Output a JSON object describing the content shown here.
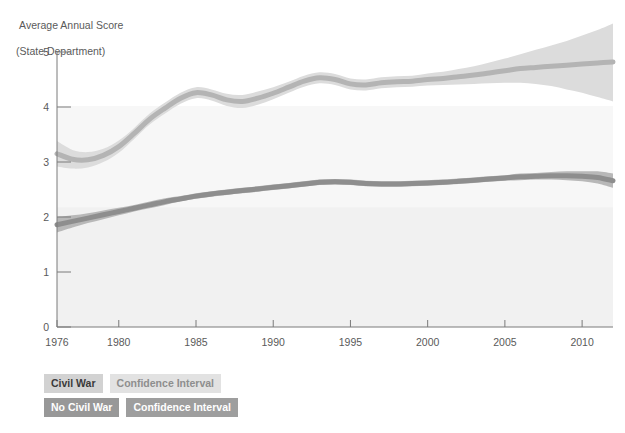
{
  "chart_data": {
    "type": "line",
    "title": "Average Annual Score",
    "subtitle": "(State Department)",
    "ylabel": "Average Annual Score (State Department)",
    "xlabel": "",
    "ylim": [
      0,
      5
    ],
    "xlim": [
      1976,
      2012
    ],
    "grid": false,
    "legend_position": "below-left",
    "y_ticks": [
      "0",
      "1",
      "2",
      "3",
      "4",
      "5"
    ],
    "y_tick_values": [
      0,
      1,
      2,
      3,
      4,
      5
    ],
    "x_ticks": [
      "1976",
      "1980",
      "1985",
      "1990",
      "1995",
      "2000",
      "2005",
      "2010"
    ],
    "x_tick_values": [
      1976,
      1980,
      1985,
      1990,
      1995,
      2000,
      2005,
      2010
    ],
    "x": [
      1976,
      1977,
      1978,
      1979,
      1980,
      1981,
      1982,
      1983,
      1984,
      1985,
      1986,
      1987,
      1988,
      1989,
      1990,
      1991,
      1992,
      1993,
      1994,
      1995,
      1996,
      1997,
      1998,
      1999,
      2000,
      2001,
      2002,
      2003,
      2004,
      2005,
      2006,
      2007,
      2008,
      2009,
      2010,
      2011,
      2012
    ],
    "series": [
      {
        "name": "Civil War",
        "color": "#b4b4b4",
        "band_color": "#dcdcdc",
        "values": [
          3.15,
          3.05,
          3.04,
          3.12,
          3.28,
          3.52,
          3.78,
          3.98,
          4.16,
          4.26,
          4.22,
          4.13,
          4.1,
          4.16,
          4.25,
          4.36,
          4.47,
          4.53,
          4.5,
          4.42,
          4.4,
          4.44,
          4.46,
          4.47,
          4.5,
          4.52,
          4.55,
          4.58,
          4.62,
          4.66,
          4.7,
          4.72,
          4.74,
          4.76,
          4.78,
          4.8,
          4.82
        ],
        "ci_lower": [
          2.92,
          2.88,
          2.9,
          3.0,
          3.17,
          3.42,
          3.68,
          3.88,
          4.06,
          4.16,
          4.12,
          4.02,
          3.98,
          4.04,
          4.14,
          4.26,
          4.37,
          4.43,
          4.4,
          4.32,
          4.3,
          4.34,
          4.36,
          4.37,
          4.39,
          4.4,
          4.41,
          4.42,
          4.43,
          4.44,
          4.44,
          4.42,
          4.38,
          4.32,
          4.26,
          4.18,
          4.1
        ],
        "ci_upper": [
          3.38,
          3.22,
          3.18,
          3.24,
          3.39,
          3.62,
          3.88,
          4.08,
          4.26,
          4.36,
          4.32,
          4.24,
          4.22,
          4.28,
          4.36,
          4.46,
          4.57,
          4.63,
          4.6,
          4.52,
          4.5,
          4.54,
          4.56,
          4.57,
          4.61,
          4.64,
          4.69,
          4.74,
          4.81,
          4.88,
          4.96,
          5.04,
          5.12,
          5.2,
          5.3,
          5.4,
          5.52
        ]
      },
      {
        "name": "No Civil War",
        "color": "#8e8e8e",
        "band_color": "#b8b8b8",
        "values": [
          1.86,
          1.92,
          1.98,
          2.04,
          2.1,
          2.16,
          2.22,
          2.28,
          2.33,
          2.38,
          2.42,
          2.45,
          2.48,
          2.51,
          2.54,
          2.57,
          2.6,
          2.63,
          2.64,
          2.63,
          2.61,
          2.6,
          2.6,
          2.61,
          2.62,
          2.63,
          2.65,
          2.67,
          2.69,
          2.71,
          2.73,
          2.74,
          2.75,
          2.75,
          2.74,
          2.72,
          2.66
        ],
        "ci_lower": [
          1.72,
          1.81,
          1.89,
          1.96,
          2.03,
          2.1,
          2.16,
          2.22,
          2.28,
          2.33,
          2.37,
          2.4,
          2.43,
          2.46,
          2.49,
          2.52,
          2.55,
          2.58,
          2.59,
          2.58,
          2.56,
          2.55,
          2.55,
          2.56,
          2.57,
          2.58,
          2.6,
          2.62,
          2.64,
          2.66,
          2.67,
          2.68,
          2.68,
          2.67,
          2.65,
          2.61,
          2.53
        ],
        "ci_upper": [
          2.0,
          2.03,
          2.07,
          2.12,
          2.17,
          2.22,
          2.28,
          2.34,
          2.38,
          2.43,
          2.47,
          2.5,
          2.53,
          2.56,
          2.59,
          2.62,
          2.65,
          2.68,
          2.69,
          2.68,
          2.66,
          2.65,
          2.65,
          2.66,
          2.67,
          2.68,
          2.7,
          2.72,
          2.74,
          2.76,
          2.79,
          2.8,
          2.82,
          2.83,
          2.83,
          2.83,
          2.79
        ]
      }
    ]
  },
  "header": {
    "title_line1": "Average Annual Score",
    "title_line2": "(State Department)"
  },
  "legend": {
    "rows": [
      {
        "series_label": "Civil War",
        "ci_label": "Confidence Interval"
      },
      {
        "series_label": "No Civil War",
        "ci_label": "Confidence Interval"
      }
    ]
  },
  "colors": {
    "civil_war_line": "#b4b4b4",
    "civil_war_band": "#dcdcdc",
    "no_civil_war_line": "#8e8e8e",
    "no_civil_war_band": "#b8b8b8",
    "axis": "#7a7a7a",
    "text": "#5a5a5a",
    "plot_background_tint": "#f0f0f0"
  }
}
